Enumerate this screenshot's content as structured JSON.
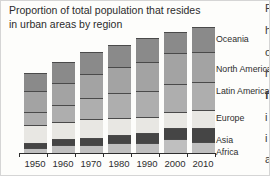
{
  "title": {
    "line1": "Proportion of total population that resides",
    "line2": "in urban areas by region"
  },
  "chart_data": {
    "type": "bar",
    "stacked": true,
    "title": "Proportion of total population that resides in urban areas by region",
    "xlabel": "",
    "ylabel": "",
    "grid": false,
    "legend_position": "right",
    "categories": [
      "1950",
      "1960",
      "1970",
      "1980",
      "1990",
      "2000",
      "2010"
    ],
    "note": "y-axis has no scale; values are relative stacked-segment heights read from the figure",
    "series": [
      {
        "name": "Africa",
        "color": "#bfbfbf",
        "values": [
          5,
          8,
          8,
          10,
          10,
          14,
          11
        ]
      },
      {
        "name": "Asia",
        "color": "#454545",
        "values": [
          5,
          6,
          7,
          8,
          10,
          11,
          14
        ]
      },
      {
        "name": "Europe",
        "color": "#e8e7e3",
        "values": [
          18,
          17,
          19,
          17,
          16,
          16,
          18
        ]
      },
      {
        "name": "Latin America",
        "color": "#aeaeae",
        "values": [
          13,
          17,
          21,
          25,
          26,
          28,
          28
        ]
      },
      {
        "name": "North America",
        "color": "#a3a3a3",
        "values": [
          21,
          22,
          24,
          26,
          29,
          31,
          30
        ]
      },
      {
        "name": "Oceania",
        "color": "#8a8a8a",
        "values": [
          18,
          21,
          22,
          22,
          24,
          21,
          25
        ]
      }
    ],
    "totals": [
      80,
      91,
      101,
      108,
      115,
      121,
      126
    ]
  },
  "legend": {
    "items": [
      {
        "label": "Oceania",
        "y": 33
      },
      {
        "label": "North America",
        "y": 63
      },
      {
        "label": "Latin America",
        "y": 85
      },
      {
        "label": "Europe",
        "y": 112
      },
      {
        "label": "Asia",
        "y": 134
      },
      {
        "label": "Africa",
        "y": 146
      }
    ]
  },
  "side_text": {
    "description": "left edge of an adjacent text column, cut off at the screenshot border",
    "fragments": [
      {
        "ch": "P",
        "y": 1,
        "bold": false
      },
      {
        "ch": "h",
        "y": 23,
        "bold": false
      },
      {
        "ch": "o",
        "y": 45,
        "bold": false
      },
      {
        "ch": "h",
        "y": 66,
        "bold": false
      },
      {
        "ch": "f",
        "y": 88,
        "bold": true
      },
      {
        "ch": "i",
        "y": 110,
        "bold": false
      },
      {
        "ch": "i",
        "y": 131,
        "bold": false
      },
      {
        "ch": "a",
        "y": 152,
        "bold": false
      }
    ]
  },
  "colors": {
    "background": "#fdfdfb",
    "frame_border": "#d5d5d5",
    "text": "#2e2e2e",
    "axis": "#2d2d2d",
    "segment_divider": "#4a4a4a"
  },
  "layout_hints": {
    "axis_left": 18,
    "axis_width": 197,
    "slot_width": 28,
    "bar_width": 23,
    "baseline_y": 152
  }
}
